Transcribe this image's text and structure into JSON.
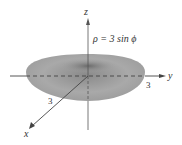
{
  "diagram": {
    "equation": "ρ = 3 sin ϕ",
    "axes": {
      "x": "x",
      "y": "y",
      "z": "z"
    },
    "tick_labels": {
      "x": "3",
      "y": "3"
    },
    "surface": "torus",
    "colors": {
      "surface": "#9a9a9a",
      "surface_dark": "#6e6e6e",
      "axis": "#555555"
    }
  }
}
